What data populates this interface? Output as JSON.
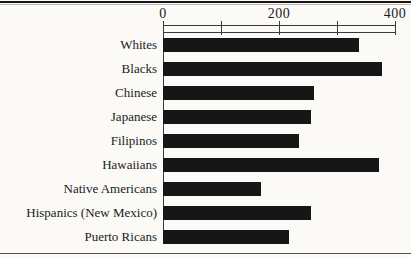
{
  "page": {
    "background_color": "#fbfaf6",
    "top_rule_color": "#161616",
    "bottom_rule_color": "#55534e"
  },
  "chart_data": {
    "type": "bar",
    "orientation": "horizontal",
    "title": "",
    "xlabel": "",
    "ylabel": "",
    "categories": [
      "Whites",
      "Blacks",
      "Chinese",
      "Japanese",
      "Filipinos",
      "Hawaiians",
      "Native Americans",
      "Hispanics (New Mexico)",
      "Puerto Ricans"
    ],
    "values": [
      338,
      377,
      260,
      255,
      234,
      372,
      169,
      255,
      217
    ],
    "xlim": [
      0,
      400
    ],
    "x_ticks": [
      0,
      100,
      200,
      300,
      400
    ],
    "x_tick_labels": [
      "0",
      "",
      "200",
      "",
      "400"
    ],
    "axis_position": "top",
    "grid": false,
    "legend": false,
    "bar_color": "#161616",
    "axis_color": "#3a3a38",
    "text_color": "#1a1a1a"
  }
}
